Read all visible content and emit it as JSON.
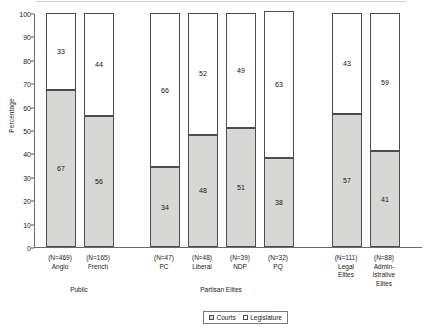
{
  "chart_data": {
    "type": "bar",
    "subtype": "stacked-column-100",
    "title": "",
    "xlabel": "",
    "ylabel": "Percentage",
    "ylim": [
      0,
      100
    ],
    "ytick_step": 10,
    "yticks": [
      0,
      10,
      20,
      30,
      40,
      50,
      60,
      70,
      80,
      90,
      100
    ],
    "grid": false,
    "legend_position": "bottom-center",
    "categories": [
      "Anglo",
      "French",
      "PC",
      "Liberal",
      "NDP",
      "PQ",
      "Legal Elites",
      "Administrative Elites"
    ],
    "category_sublabels": [
      "(N=469)\nAnglo",
      "(N=165)\nFrench",
      "(N=47)\nPC",
      "(N=48)\nLiberal",
      "(N=39)\nNDP",
      "(N=32)\nPQ",
      "(N=111)\nLegal\nElites",
      "(N=88)\nAdmin-\nistrative\nElites"
    ],
    "sample_sizes": [
      469,
      165,
      47,
      48,
      39,
      32,
      111,
      88
    ],
    "groups": [
      {
        "label": "Public",
        "members": [
          "Anglo",
          "French"
        ]
      },
      {
        "label": "Partisan Elites",
        "members": [
          "PC",
          "Liberal",
          "NDP",
          "PQ"
        ]
      },
      {
        "label": "",
        "members": [
          "Legal Elites",
          "Administrative Elites"
        ]
      }
    ],
    "series": [
      {
        "name": "Courts",
        "color": "#d7d7d5",
        "values": [
          67,
          56,
          34,
          48,
          51,
          38,
          57,
          41
        ]
      },
      {
        "name": "Legislature",
        "color": "#ffffff",
        "values": [
          33,
          44,
          66,
          52,
          49,
          63,
          43,
          59
        ]
      }
    ]
  },
  "legend": {
    "items": [
      {
        "label": "Courts"
      },
      {
        "label": "Legislature"
      }
    ]
  },
  "axis": {
    "y_title": "Percentage"
  },
  "group_labels": {
    "public": "Public",
    "partisan": "Partisan Elites"
  }
}
